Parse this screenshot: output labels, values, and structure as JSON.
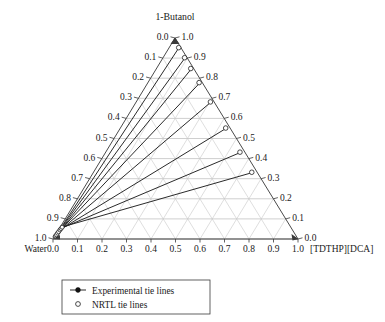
{
  "figure": {
    "apex_label": "1-Butanol",
    "left_corner_label": "Water",
    "right_corner_label": "[TDTHP][DCA]"
  },
  "legend": {
    "items": [
      {
        "label": "Experimental tie lines",
        "marker": "filled-circle-with-line"
      },
      {
        "label": "NRTL tie lines",
        "marker": "open-circle"
      }
    ]
  },
  "ticks": {
    "left_axis": [
      "0.0",
      "0.1",
      "0.2",
      "0.3",
      "0.4",
      "0.5",
      "0.6",
      "0.7",
      "0.8",
      "0.9",
      "1.0"
    ],
    "right_axis": [
      "1.0",
      "0.9",
      "0.8",
      "0.7",
      "0.6",
      "0.5",
      "0.4",
      "0.3",
      "0.2",
      "0.1",
      "0.0"
    ],
    "bottom_axis": [
      "0.0",
      "0.1",
      "0.2",
      "0.3",
      "0.4",
      "0.5",
      "0.6",
      "0.7",
      "0.8",
      "0.9",
      "1.0"
    ]
  },
  "colors": {
    "grid": "#c8c8c8",
    "edge": "#4a4a4a",
    "tie_line": "#1f1f1f",
    "marker_fill": "#ffffff",
    "background": "#ffffff"
  },
  "chart_data": {
    "type": "scatter",
    "title": "",
    "subtitle": "",
    "plot_kind": "ternary-phase-diagram",
    "components": {
      "top": "1-Butanol",
      "left": "Water",
      "right": "[TDTHP][DCA]"
    },
    "axis_ranges": {
      "top": [
        0,
        1
      ],
      "left": [
        0,
        1
      ],
      "right": [
        0,
        1
      ]
    },
    "tick_interval": 0.1,
    "grid": true,
    "legend_position": "bottom-left",
    "legend_entries": [
      "Experimental tie lines",
      "NRTL tie lines"
    ],
    "series": [
      {
        "name": "Experimental tie lines",
        "marker": "filled-circle",
        "tie_lines": [
          {
            "water_rich": {
              "water": 0.985,
              "butanol": 0.012,
              "il": 0.003
            },
            "il_rich": {
              "water": 0.01,
              "butanol": 0.95,
              "il": 0.04
            }
          },
          {
            "water_rich": {
              "water": 0.98,
              "butanol": 0.017,
              "il": 0.003
            },
            "il_rich": {
              "water": 0.01,
              "butanol": 0.9,
              "il": 0.09
            }
          },
          {
            "water_rich": {
              "water": 0.974,
              "butanol": 0.022,
              "il": 0.004
            },
            "il_rich": {
              "water": 0.012,
              "butanol": 0.845,
              "il": 0.143
            }
          },
          {
            "water_rich": {
              "water": 0.966,
              "butanol": 0.03,
              "il": 0.004
            },
            "il_rich": {
              "water": 0.013,
              "butanol": 0.775,
              "il": 0.212
            }
          },
          {
            "water_rich": {
              "water": 0.958,
              "butanol": 0.037,
              "il": 0.005
            },
            "il_rich": {
              "water": 0.015,
              "butanol": 0.68,
              "il": 0.305
            }
          },
          {
            "water_rich": {
              "water": 0.948,
              "butanol": 0.046,
              "il": 0.006
            },
            "il_rich": {
              "water": 0.018,
              "butanol": 0.55,
              "il": 0.432
            }
          },
          {
            "water_rich": {
              "water": 0.94,
              "butanol": 0.053,
              "il": 0.007
            },
            "il_rich": {
              "water": 0.02,
              "butanol": 0.43,
              "il": 0.55
            }
          },
          {
            "water_rich": {
              "water": 0.932,
              "butanol": 0.06,
              "il": 0.008
            },
            "il_rich": {
              "water": 0.022,
              "butanol": 0.33,
              "il": 0.648
            }
          }
        ]
      },
      {
        "name": "NRTL tie lines",
        "marker": "open-circle",
        "tie_lines": [
          {
            "water_rich": {
              "water": 0.986,
              "butanol": 0.011,
              "il": 0.003
            },
            "il_rich": {
              "water": 0.009,
              "butanol": 0.952,
              "il": 0.039
            }
          },
          {
            "water_rich": {
              "water": 0.981,
              "butanol": 0.016,
              "il": 0.003
            },
            "il_rich": {
              "water": 0.01,
              "butanol": 0.902,
              "il": 0.088
            }
          },
          {
            "water_rich": {
              "water": 0.975,
              "butanol": 0.021,
              "il": 0.004
            },
            "il_rich": {
              "water": 0.012,
              "butanol": 0.848,
              "il": 0.14
            }
          },
          {
            "water_rich": {
              "water": 0.967,
              "butanol": 0.029,
              "il": 0.004
            },
            "il_rich": {
              "water": 0.013,
              "butanol": 0.778,
              "il": 0.209
            }
          },
          {
            "water_rich": {
              "water": 0.959,
              "butanol": 0.036,
              "il": 0.005
            },
            "il_rich": {
              "water": 0.015,
              "butanol": 0.682,
              "il": 0.303
            }
          },
          {
            "water_rich": {
              "water": 0.949,
              "butanol": 0.045,
              "il": 0.006
            },
            "il_rich": {
              "water": 0.018,
              "butanol": 0.552,
              "il": 0.43
            }
          },
          {
            "water_rich": {
              "water": 0.941,
              "butanol": 0.052,
              "il": 0.007
            },
            "il_rich": {
              "water": 0.02,
              "butanol": 0.432,
              "il": 0.548
            }
          },
          {
            "water_rich": {
              "water": 0.933,
              "butanol": 0.059,
              "il": 0.008
            },
            "il_rich": {
              "water": 0.022,
              "butanol": 0.332,
              "il": 0.646
            }
          }
        ]
      }
    ]
  }
}
